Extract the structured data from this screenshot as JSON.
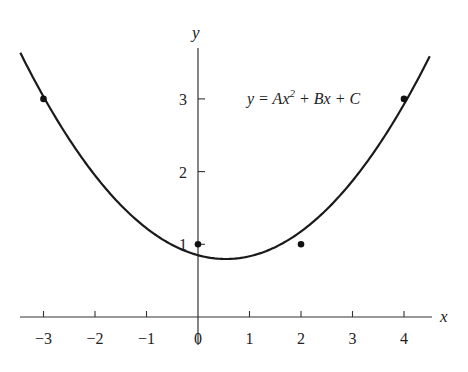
{
  "chart_data": {
    "type": "scatter",
    "title": "",
    "xlabel": "x",
    "ylabel": "y",
    "xlim": [
      -3.5,
      4.6
    ],
    "ylim": [
      0,
      3.8
    ],
    "grid": false,
    "x_ticks": [
      -3,
      -2,
      -1,
      0,
      1,
      2,
      3,
      4
    ],
    "x_tick_labels": [
      "−3",
      "−2",
      "−1",
      "0",
      "1",
      "2",
      "3",
      "4"
    ],
    "y_ticks": [
      1,
      2,
      3
    ],
    "y_tick_labels": [
      "1",
      "2",
      "3"
    ],
    "series": [
      {
        "name": "data points",
        "type": "scatter",
        "x": [
          -3,
          0,
          2,
          4
        ],
        "y": [
          3,
          1,
          1,
          3
        ]
      },
      {
        "name": "fitted parabola",
        "type": "line",
        "equation": "y = Ax² + Bx + C",
        "coefficients": {
          "A": 0.178,
          "B": -0.193,
          "C": 0.85
        },
        "x_range": [
          -3.45,
          4.5
        ]
      }
    ],
    "annotations": [
      {
        "text_main": "y = Ax",
        "text_sup": "2",
        "text_rest": " + Bx + C",
        "x": 1.0,
        "y": 3.0
      }
    ]
  },
  "labels": {
    "x_axis": "x",
    "y_axis": "y",
    "equation_main": "y = Ax",
    "equation_sup": "2",
    "equation_rest": " + Bx + C"
  }
}
